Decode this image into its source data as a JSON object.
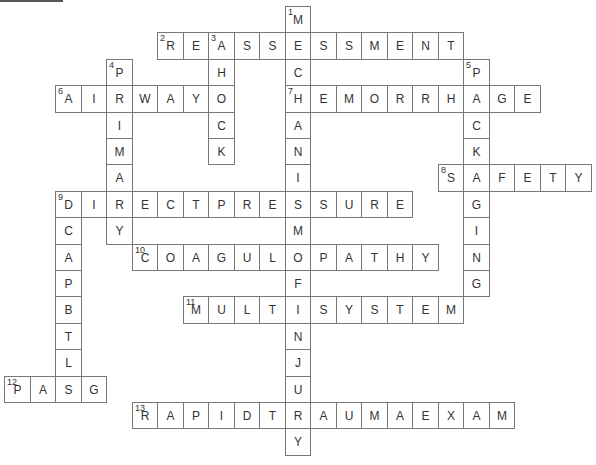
{
  "puzzle": {
    "origin": {
      "x": 4,
      "y": 6
    },
    "cell_w": 25.5,
    "cell_h": 26.4,
    "words": [
      {
        "number": "1",
        "answer": "MECHANISMOFINJURY",
        "direction": "down",
        "col": 11,
        "row": 0
      },
      {
        "number": "2",
        "answer": "REASSESSMENT",
        "direction": "across",
        "col": 6,
        "row": 1
      },
      {
        "number": "3",
        "answer": "SHOCK",
        "direction": "down",
        "col": 8,
        "row": 1
      },
      {
        "number": "4",
        "answer": "PRIMARY",
        "direction": "down",
        "col": 4,
        "row": 2
      },
      {
        "number": "5",
        "answer": "PACKAGING",
        "direction": "down",
        "col": 18,
        "row": 2
      },
      {
        "number": "6",
        "answer": "AIRWAY",
        "direction": "across",
        "col": 2,
        "row": 3
      },
      {
        "number": "7",
        "answer": "HEMORRHAGE",
        "direction": "across",
        "col": 11,
        "row": 3
      },
      {
        "number": "8",
        "answer": "SAFETY",
        "direction": "across",
        "col": 17,
        "row": 6
      },
      {
        "number": "9",
        "answer": "DIRECTPRESSURE",
        "direction": "across",
        "col": 2,
        "row": 7
      },
      {
        "number": "9",
        "answer": "DCAPBTLS",
        "direction": "down",
        "col": 2,
        "row": 7
      },
      {
        "number": "10",
        "answer": "COAGULOPATHY",
        "direction": "across",
        "col": 5,
        "row": 9
      },
      {
        "number": "11",
        "answer": "MULTISYSTEM",
        "direction": "across",
        "col": 7,
        "row": 11
      },
      {
        "number": "12",
        "answer": "PASG",
        "direction": "across",
        "col": 0,
        "row": 14
      },
      {
        "number": "13",
        "answer": "RAPIDTRAUMAEXAM",
        "direction": "across",
        "col": 5,
        "row": 15
      }
    ]
  }
}
